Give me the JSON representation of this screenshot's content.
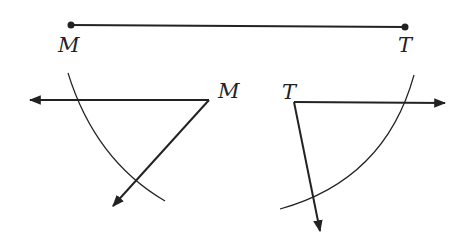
{
  "diagram": {
    "segment": {
      "start_label": "M",
      "end_label": "T"
    },
    "left_figure": {
      "vertex_label": "M"
    },
    "right_figure": {
      "vertex_label": "T"
    },
    "colors": {
      "stroke": "#222222",
      "background": "#ffffff"
    }
  }
}
